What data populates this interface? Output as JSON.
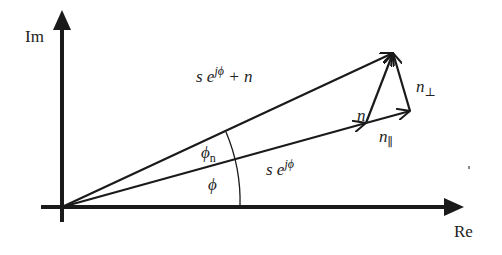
{
  "diagram": {
    "colors": {
      "stroke": "#1a1a1a",
      "text": "#222222",
      "background": "#ffffff"
    },
    "axes": {
      "vertical_label": "Im",
      "horizontal_label": "Re"
    },
    "vectors": [
      {
        "id": "signal",
        "label_main": "s e",
        "label_sup": "jϕ",
        "label_tail": ""
      },
      {
        "id": "signal-plus-noise",
        "label_main": "s e",
        "label_sup": "jϕ",
        "label_tail": " + n"
      },
      {
        "id": "noise",
        "label_main": "n"
      },
      {
        "id": "noise-parallel",
        "label_main": "n",
        "label_sub": "∥"
      },
      {
        "id": "noise-perpendicular",
        "label_main": "n",
        "label_sub": "⊥"
      }
    ],
    "angles": [
      {
        "id": "phi",
        "label_main": "ϕ"
      },
      {
        "id": "phi-n",
        "label_main": "ϕ",
        "label_sub": "n"
      }
    ]
  }
}
